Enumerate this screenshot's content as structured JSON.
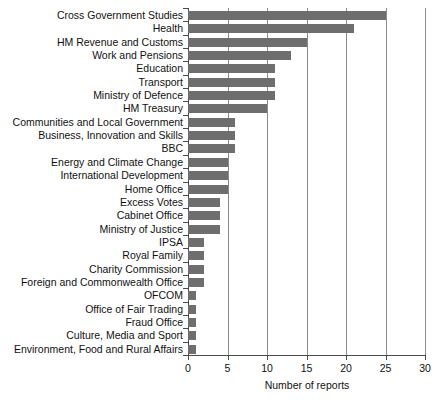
{
  "chart_data": {
    "type": "bar",
    "orientation": "horizontal",
    "title": "",
    "xlabel": "Number of reports",
    "ylabel": "",
    "xlim": [
      0,
      30
    ],
    "xticks": [
      0,
      5,
      10,
      15,
      20,
      25,
      30
    ],
    "grid": "vertical",
    "legend": "none",
    "bar_color": "#6e6e6e",
    "categories": [
      "Cross Government Studies",
      "Health",
      "HM Revenue and Customs",
      "Work and Pensions",
      "Education",
      "Transport",
      "Ministry of Defence",
      "HM Treasury",
      "Communities and Local Government",
      "Business, Innovation and Skills",
      "BBC",
      "Energy and Climate Change",
      "International Development",
      "Home Office",
      "Excess Votes",
      "Cabinet Office",
      "Ministry of Justice",
      "IPSA",
      "Royal Family",
      "Charity Commission",
      "Foreign and Commonwealth Office",
      "OFCOM",
      "Office of Fair Trading",
      "Fraud Office",
      "Culture, Media and Sport",
      "Environment, Food and Rural Affairs"
    ],
    "values": [
      25,
      21,
      15,
      13,
      11,
      11,
      11,
      10,
      6,
      6,
      6,
      5,
      5,
      5,
      4,
      4,
      4,
      2,
      2,
      2,
      2,
      1,
      1,
      1,
      1,
      1
    ]
  }
}
